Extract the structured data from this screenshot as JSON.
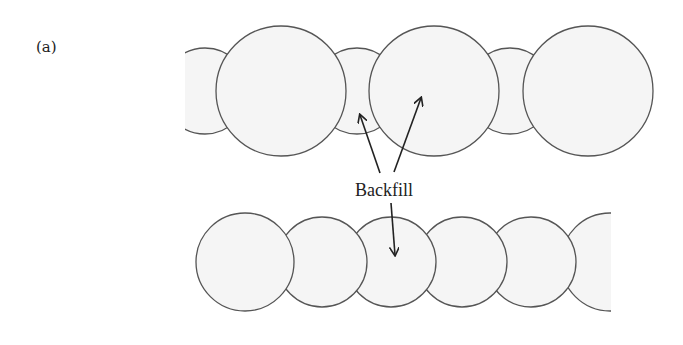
{
  "figure": {
    "panel_label": "(a)",
    "annotation": "Backfill",
    "colors": {
      "circle_fill": "#f5f5f5",
      "circle_stroke": "#555555",
      "arrow": "#222222",
      "text": "#222222"
    },
    "top_row": {
      "description": "Alternating large and small overlapping circles",
      "circles": [
        {
          "type": "small",
          "cx": 205,
          "cy": 91,
          "r": 43,
          "clipped": "left"
        },
        {
          "type": "large",
          "cx": 281,
          "cy": 91,
          "r": 65
        },
        {
          "type": "small",
          "cx": 357,
          "cy": 91,
          "r": 43
        },
        {
          "type": "large",
          "cx": 434,
          "cy": 91,
          "r": 65
        },
        {
          "type": "small",
          "cx": 510,
          "cy": 91,
          "r": 43
        },
        {
          "type": "large",
          "cx": 588,
          "cy": 91,
          "r": 65
        }
      ]
    },
    "bottom_row": {
      "description": "Equal-size overlapping circles",
      "circles": [
        {
          "cx": 245,
          "cy": 262,
          "r": 49
        },
        {
          "cx": 322,
          "cy": 262,
          "r": 49
        },
        {
          "cx": 391,
          "cy": 262,
          "r": 49
        },
        {
          "cx": 462,
          "cy": 262,
          "r": 49
        },
        {
          "cx": 531,
          "cy": 262,
          "r": 49
        },
        {
          "cx": 610,
          "cy": 262,
          "r": 49,
          "clipped": "right"
        }
      ]
    },
    "arrows": [
      {
        "from": [
          380,
          173
        ],
        "to": [
          360,
          115
        ],
        "target": "top-row small circle"
      },
      {
        "from": [
          394,
          172
        ],
        "to": [
          421,
          98
        ],
        "target": "top-row large circle"
      },
      {
        "from": [
          391,
          203
        ],
        "to": [
          395,
          255
        ],
        "target": "bottom-row circle"
      }
    ]
  }
}
